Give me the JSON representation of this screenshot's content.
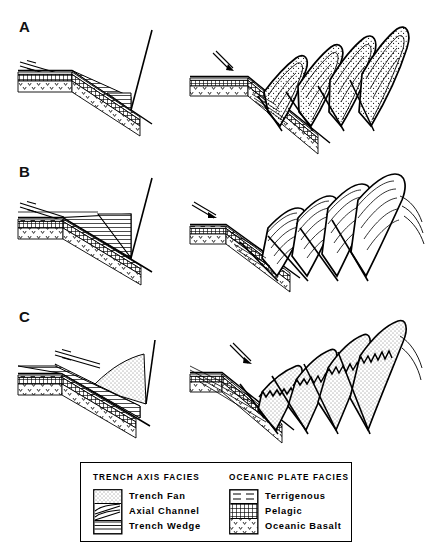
{
  "figure": {
    "background_color": "#ffffff",
    "ink_color": "#000000",
    "panels": [
      {
        "label": "A",
        "stage_left": "initial trench with thin trench wedge",
        "stage_right": "accretionary prism of imbricated slices"
      },
      {
        "label": "B",
        "stage_left": "thick horizontally-laminated trench wedge",
        "stage_right": "imbricate stack of wedge slices"
      },
      {
        "label": "C",
        "stage_left": "stippled trench fan over trench wedge",
        "stage_right": "imbricate slices of fan and wedge"
      }
    ]
  },
  "legend": {
    "left": {
      "header": "TRENCH AXIS FACIES",
      "items": [
        {
          "label": "Trench Fan",
          "pattern": "stipple"
        },
        {
          "label": "Axial Channel",
          "pattern": "lens"
        },
        {
          "label": "Trench Wedge",
          "pattern": "horizontal-lines"
        }
      ]
    },
    "right": {
      "header": "OCEANIC PLATE FACIES",
      "items": [
        {
          "label": "Terrigenous",
          "pattern": "dashes"
        },
        {
          "label": "Pelagic",
          "pattern": "grid"
        },
        {
          "label": "Oceanic Basalt",
          "pattern": "v-marks"
        }
      ]
    }
  }
}
